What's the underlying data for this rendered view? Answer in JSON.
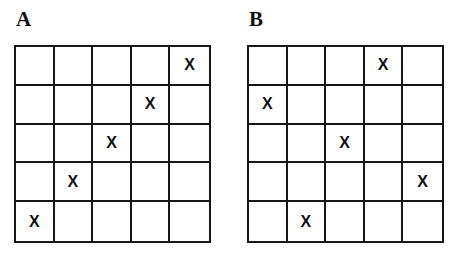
{
  "figure": {
    "title": "",
    "background_color": "#ffffff",
    "line_color": "#161616",
    "mark_color": "#121212",
    "mark_glyph": "X",
    "grid_rows": 5,
    "grid_columns": 5
  },
  "panels": [
    {
      "label": "A",
      "name": "grid-a",
      "marks": [
        {
          "row": 1,
          "col": 5
        },
        {
          "row": 2,
          "col": 4
        },
        {
          "row": 3,
          "col": 3
        },
        {
          "row": 4,
          "col": 2
        },
        {
          "row": 5,
          "col": 1
        }
      ]
    },
    {
      "label": "B",
      "name": "grid-b",
      "marks": [
        {
          "row": 1,
          "col": 4
        },
        {
          "row": 2,
          "col": 1
        },
        {
          "row": 3,
          "col": 3
        },
        {
          "row": 4,
          "col": 5
        },
        {
          "row": 5,
          "col": 2
        }
      ]
    }
  ],
  "chart_data": {
    "type": "heatmap",
    "title": "",
    "xlabel": "",
    "ylabel": "",
    "grid": true,
    "legend": "none",
    "categories": [
      "1",
      "2",
      "3",
      "4",
      "5"
    ],
    "rows": [
      "1",
      "2",
      "3",
      "4",
      "5"
    ],
    "panels": [
      {
        "name": "A",
        "description": "5x5 grid with one X per row on the anti-diagonal",
        "matrix": [
          [
            0,
            0,
            0,
            0,
            1
          ],
          [
            0,
            0,
            0,
            1,
            0
          ],
          [
            0,
            0,
            1,
            0,
            0
          ],
          [
            0,
            1,
            0,
            0,
            0
          ],
          [
            1,
            0,
            0,
            0,
            0
          ]
        ],
        "marked_columns_by_row": [
          5,
          4,
          3,
          2,
          1
        ]
      },
      {
        "name": "B",
        "description": "5x5 grid with one X per row, non-attacking scattered placement",
        "matrix": [
          [
            0,
            0,
            0,
            1,
            0
          ],
          [
            1,
            0,
            0,
            0,
            0
          ],
          [
            0,
            0,
            1,
            0,
            0
          ],
          [
            0,
            0,
            0,
            0,
            1
          ],
          [
            0,
            1,
            0,
            0,
            0
          ]
        ],
        "marked_columns_by_row": [
          4,
          1,
          3,
          5,
          2
        ]
      }
    ]
  }
}
